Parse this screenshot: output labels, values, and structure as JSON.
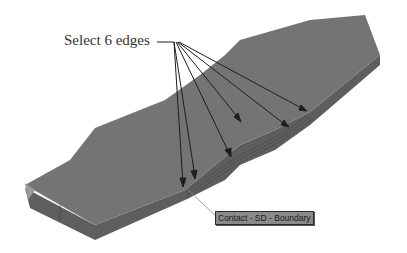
{
  "annotation": {
    "label": "Select 6 edges",
    "arrow_count": 6
  },
  "tooltip": {
    "text": "Contact - SD - Boundary"
  },
  "colors": {
    "part_top": "#707070",
    "part_side": "#5a5a5a",
    "arrow": "#1e1e1e",
    "background": "#ffffff"
  }
}
